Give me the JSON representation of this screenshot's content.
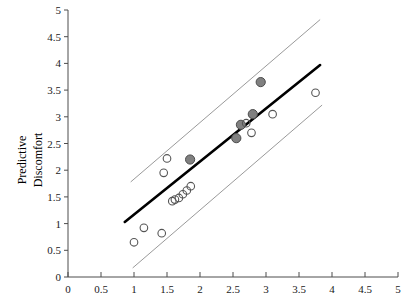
{
  "chart_data": {
    "type": "scatter",
    "title": "",
    "xlabel": "",
    "ylabel": "Predictive Discomfort",
    "ylabel_line1": "Predictive",
    "ylabel_line2": "Discomfort",
    "xlim": [
      0,
      5
    ],
    "ylim": [
      0,
      5
    ],
    "xticks": [
      "0",
      "0.5",
      "1",
      "1.5",
      "2",
      "2.5",
      "3",
      "3.5",
      "4",
      "4.5",
      "5"
    ],
    "xtick_values": [
      0,
      0.5,
      1,
      1.5,
      2,
      2.5,
      3,
      3.5,
      4,
      4.5,
      5
    ],
    "yticks": [
      "0",
      "0.5",
      "1",
      "1.5",
      "2",
      "2.5",
      "3",
      "3.5",
      "4",
      "4.5",
      "5"
    ],
    "ytick_values": [
      0,
      0.5,
      1,
      1.5,
      2,
      2.5,
      3,
      3.5,
      4,
      4.5,
      5
    ],
    "grid": false,
    "legend": "none",
    "colors": {
      "filled_marker_fill": "#808080",
      "filled_marker_edge": "#4d4d4d",
      "open_marker_edge": "#555555",
      "fit_line": "#000000",
      "band_line": "#9a9a9a",
      "axis": "#4d4d4d",
      "text": "#1a1a1a"
    },
    "series": [
      {
        "name": "filled",
        "marker": "filled-circle",
        "points": [
          {
            "x": 1.85,
            "y": 2.2
          },
          {
            "x": 2.55,
            "y": 2.6
          },
          {
            "x": 2.62,
            "y": 2.85
          },
          {
            "x": 2.8,
            "y": 3.05
          },
          {
            "x": 2.92,
            "y": 3.65
          }
        ]
      },
      {
        "name": "open",
        "marker": "open-circle",
        "points": [
          {
            "x": 1.0,
            "y": 0.65
          },
          {
            "x": 1.15,
            "y": 0.92
          },
          {
            "x": 1.42,
            "y": 0.82
          },
          {
            "x": 1.45,
            "y": 1.95
          },
          {
            "x": 1.5,
            "y": 2.22
          },
          {
            "x": 1.58,
            "y": 1.42
          },
          {
            "x": 1.62,
            "y": 1.45
          },
          {
            "x": 1.68,
            "y": 1.48
          },
          {
            "x": 1.74,
            "y": 1.55
          },
          {
            "x": 1.8,
            "y": 1.62
          },
          {
            "x": 1.86,
            "y": 1.7
          },
          {
            "x": 2.7,
            "y": 2.88
          },
          {
            "x": 2.78,
            "y": 2.7
          },
          {
            "x": 3.1,
            "y": 3.05
          },
          {
            "x": 3.75,
            "y": 3.45
          }
        ]
      }
    ],
    "fit_line": {
      "name": "regression-line",
      "x1": 0.86,
      "y1": 1.03,
      "x2": 3.82,
      "y2": 3.97
    },
    "bands": [
      {
        "name": "upper-confidence-band",
        "x1": 0.95,
        "y1": 1.78,
        "x2": 3.82,
        "y2": 4.82
      },
      {
        "name": "lower-confidence-band",
        "x1": 0.98,
        "y1": 0.17,
        "x2": 3.85,
        "y2": 3.22
      }
    ]
  }
}
